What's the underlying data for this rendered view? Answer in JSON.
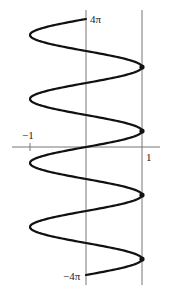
{
  "chart_data": {
    "type": "line",
    "title": "",
    "xlabel": "",
    "ylabel": "",
    "xlim": [
      -1,
      1
    ],
    "ylim": [
      "-4π",
      "4π"
    ],
    "x_tick_labels": [
      "-1",
      "1"
    ],
    "y_tick_labels": [
      "4π",
      "-4π"
    ],
    "series": [
      {
        "name": "x = sin(y)",
        "function": "sin",
        "t_range": [
          -12.566,
          12.566
        ]
      }
    ],
    "reference_lines": [
      {
        "type": "vertical",
        "x": 1
      }
    ],
    "points": [
      {
        "x": 1,
        "y": "3π/2·(-1)... at y = -7π/2"
      },
      {
        "x": 1,
        "y": "-3π/2"
      },
      {
        "x": 1,
        "y": "π/2"
      },
      {
        "x": 1,
        "y": "5π/2"
      }
    ],
    "tangency_y_values": [
      "-7π/2",
      "-3π/2",
      "π/2",
      "5π/2"
    ],
    "grid": false,
    "legend": "none"
  },
  "labels": {
    "top": "4π",
    "bottom": "−4π",
    "left": "−1",
    "right": "1"
  },
  "colors": {
    "curve": "#111111",
    "axis": "#777777"
  }
}
